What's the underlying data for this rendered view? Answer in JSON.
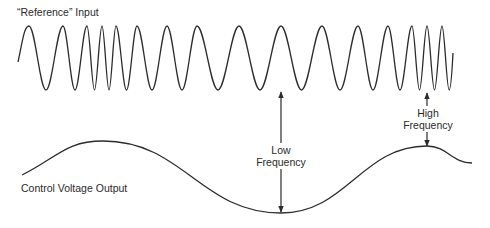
{
  "diagram": {
    "input_label": "“Reference” Input",
    "output_label": "Control Voltage Output",
    "low_label": [
      "Low",
      "Frequency"
    ],
    "high_label": [
      "High",
      "Frequency"
    ],
    "colors": {
      "line": "#2b2b2b",
      "background": "#ffffff"
    },
    "reference_wave": {
      "peak_y": 26,
      "trough_y": 90,
      "start": [
        18,
        62
      ],
      "end": [
        453,
        53
      ],
      "peak_x": [
        29,
        63,
        87,
        102,
        116,
        137,
        167,
        197,
        239,
        281,
        322,
        358,
        388,
        412,
        427,
        442
      ]
    },
    "control_voltage": {
      "points": [
        [
          22,
          175
        ],
        [
          103,
          141
        ],
        [
          281,
          213
        ],
        [
          427,
          146
        ],
        [
          472,
          163
        ]
      ]
    },
    "arrows": {
      "low": {
        "x": 281,
        "top": 92,
        "bottom": 212
      },
      "high": {
        "x": 427,
        "up_top": 93,
        "up_bottom": 106,
        "down_top": 132,
        "down_bottom": 146
      }
    }
  }
}
